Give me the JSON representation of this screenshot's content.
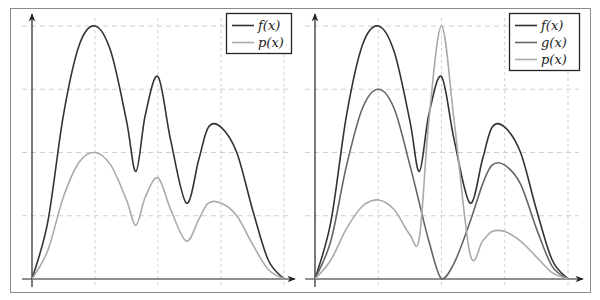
{
  "colors": {
    "frame": "#8a8a8a",
    "axis": "#222222",
    "grid": "#cfcfcf",
    "f": "#333333",
    "g": "#666666",
    "p": "#aaaaaa",
    "legend_border": "#222222"
  },
  "chart_data": [
    {
      "type": "line",
      "title": "",
      "xlabel": "",
      "ylabel": "",
      "grid": true,
      "grid_style": "dashed",
      "axis_ticks_labeled": false,
      "legend_position": "top-right",
      "xlim": [
        0,
        4
      ],
      "ylim": [
        0,
        4
      ],
      "x": [
        0,
        0.25,
        0.5,
        0.75,
        1.0,
        1.25,
        1.5,
        1.65,
        1.8,
        2.0,
        2.2,
        2.45,
        2.65,
        2.8,
        3.0,
        3.25,
        3.5,
        3.75,
        4.0
      ],
      "series": [
        {
          "name": "f(x)",
          "label": "f(x)",
          "color": "#333333",
          "values": [
            0,
            0.9,
            2.6,
            3.7,
            4.0,
            3.6,
            2.5,
            1.7,
            2.6,
            3.2,
            2.2,
            1.2,
            1.9,
            2.4,
            2.4,
            2.0,
            1.1,
            0.3,
            0
          ]
        },
        {
          "name": "p(x)",
          "label": "p(x)",
          "color": "#aaaaaa",
          "values": [
            0,
            0.45,
            1.3,
            1.85,
            2.0,
            1.8,
            1.25,
            0.85,
            1.3,
            1.6,
            1.1,
            0.6,
            0.95,
            1.2,
            1.2,
            1.0,
            0.55,
            0.15,
            0
          ]
        }
      ],
      "annotations": {
        "f_peaks": [
          [
            1.0,
            4.0
          ],
          [
            2.0,
            3.2
          ],
          [
            3.0,
            2.4
          ]
        ],
        "f_minima": [
          [
            1.65,
            1.7
          ],
          [
            2.45,
            1.2
          ]
        ],
        "p_peaks": [
          [
            1.0,
            2.0
          ],
          [
            2.0,
            1.6
          ],
          [
            3.0,
            1.2
          ]
        ],
        "p_minima": [
          [
            1.6,
            0.85
          ],
          [
            2.45,
            0.55
          ]
        ]
      }
    },
    {
      "type": "line",
      "title": "",
      "xlabel": "",
      "ylabel": "",
      "grid": true,
      "grid_style": "dashed",
      "axis_ticks_labeled": false,
      "legend_position": "top-right",
      "xlim": [
        0,
        4
      ],
      "ylim": [
        0,
        4
      ],
      "x": [
        0,
        0.25,
        0.5,
        0.75,
        1.0,
        1.25,
        1.5,
        1.65,
        1.8,
        2.0,
        2.2,
        2.45,
        2.65,
        2.8,
        3.0,
        3.25,
        3.5,
        3.75,
        4.0
      ],
      "series": [
        {
          "name": "f(x)",
          "label": "f(x)",
          "color": "#333333",
          "values": [
            0,
            0.9,
            2.6,
            3.7,
            4.0,
            3.6,
            2.5,
            1.7,
            2.6,
            3.2,
            2.2,
            1.2,
            1.9,
            2.4,
            2.4,
            2.0,
            1.1,
            0.3,
            0
          ]
        },
        {
          "name": "g(x)",
          "label": "g(x)",
          "color": "#666666",
          "values": [
            0,
            0.6,
            1.8,
            2.7,
            3.0,
            2.7,
            1.8,
            1.2,
            0.6,
            0,
            0.25,
            0.9,
            1.5,
            1.8,
            1.8,
            1.5,
            0.8,
            0.2,
            0
          ]
        },
        {
          "name": "p(x)",
          "label": "p(x)",
          "color": "#aaaaaa",
          "values": [
            0,
            0.3,
            0.8,
            1.15,
            1.25,
            1.1,
            0.7,
            0.65,
            2.5,
            4.0,
            2.5,
            0.4,
            0.6,
            0.75,
            0.75,
            0.6,
            0.35,
            0.1,
            0
          ]
        }
      ],
      "annotations": {
        "f_peaks": [
          [
            1.0,
            4.0
          ],
          [
            2.0,
            3.2
          ],
          [
            3.0,
            2.4
          ]
        ],
        "g_peaks": [
          [
            1.0,
            3.0
          ],
          [
            3.0,
            1.8
          ]
        ],
        "g_zero": [
          2.0,
          0
        ],
        "p_peaks": [
          [
            1.0,
            1.25
          ],
          [
            2.0,
            4.0
          ],
          [
            3.0,
            0.75
          ]
        ],
        "p_minima": [
          [
            1.6,
            0.65
          ],
          [
            2.45,
            0.4
          ]
        ]
      }
    }
  ],
  "legends": {
    "left": [
      "f(x)",
      "p(x)"
    ],
    "right": [
      "f(x)",
      "g(x)",
      "p(x)"
    ]
  }
}
